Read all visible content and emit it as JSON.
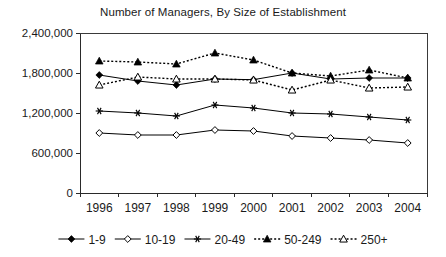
{
  "chart_data": {
    "type": "line",
    "title": "Number of Managers, By Size of Establishment",
    "xlabel": "",
    "ylabel": "",
    "x": [
      1996,
      1997,
      1998,
      1999,
      2000,
      2001,
      2002,
      2003,
      2004
    ],
    "categories": [
      "1996",
      "1997",
      "1998",
      "1999",
      "2000",
      "2001",
      "2002",
      "2003",
      "2004"
    ],
    "ylim": [
      0,
      2400000
    ],
    "yticks": [
      0,
      600000,
      1200000,
      1800000,
      2400000
    ],
    "ytick_labels": [
      "0",
      "600,000",
      "1,200,000",
      "1,800,000",
      "2,400,000"
    ],
    "grid": false,
    "legend_position": "bottom",
    "series": [
      {
        "name": "1-9",
        "marker": "filled-diamond",
        "linestyle": "solid",
        "values": [
          1770000,
          1680000,
          1620000,
          1710000,
          1700000,
          1800000,
          1710000,
          1725000,
          1725000
        ]
      },
      {
        "name": "10-19",
        "marker": "open-diamond",
        "linestyle": "solid",
        "values": [
          900000,
          870000,
          870000,
          945000,
          930000,
          855000,
          825000,
          795000,
          750000
        ]
      },
      {
        "name": "20-49",
        "marker": "star",
        "linestyle": "solid",
        "values": [
          1230000,
          1200000,
          1155000,
          1320000,
          1275000,
          1200000,
          1185000,
          1140000,
          1095000
        ]
      },
      {
        "name": "50-249",
        "marker": "filled-triangle",
        "linestyle": "dotted",
        "values": [
          1980000,
          1965000,
          1935000,
          2100000,
          1995000,
          1800000,
          1755000,
          1845000,
          1725000
        ]
      },
      {
        "name": "250+",
        "marker": "open-triangle",
        "linestyle": "dotted",
        "values": [
          1620000,
          1740000,
          1710000,
          1710000,
          1695000,
          1545000,
          1695000,
          1575000,
          1590000
        ]
      }
    ]
  }
}
